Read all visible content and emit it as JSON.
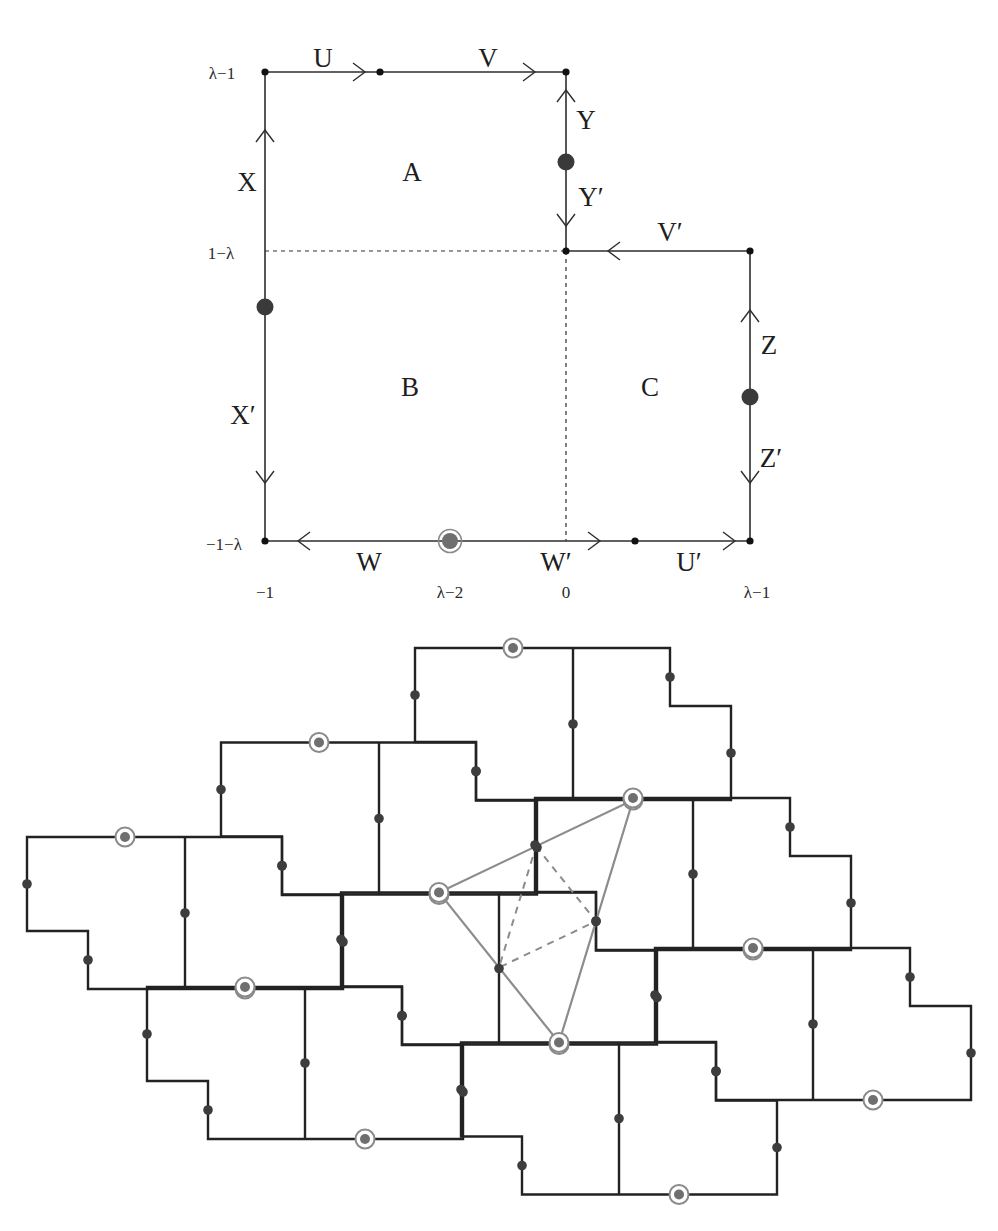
{
  "canvas": {
    "width": 998,
    "height": 1231,
    "background": "#ffffff"
  },
  "colors": {
    "top_line": "#2e2e2e",
    "tile_line": "#222222",
    "dot": "#3d3d3d",
    "marker_fill": "#6f6f6f",
    "marker_ring": "#8a8a8a",
    "triangle": "#8c8c8c"
  },
  "top_figure": {
    "outline": [
      [
        265,
        72
      ],
      [
        566,
        72
      ],
      [
        566,
        251
      ],
      [
        750,
        251
      ],
      [
        750,
        541
      ],
      [
        265,
        541
      ]
    ],
    "dashed": [
      [
        [
          265,
          251
        ],
        [
          566,
          251
        ]
      ],
      [
        [
          566,
          251
        ],
        [
          566,
          541
        ]
      ]
    ],
    "small_dots": [
      [
        265,
        72
      ],
      [
        380,
        72
      ],
      [
        566,
        72
      ],
      [
        566,
        251
      ],
      [
        750,
        251
      ],
      [
        750,
        541
      ],
      [
        635,
        541
      ],
      [
        265,
        541
      ]
    ],
    "big_dots": [
      [
        566,
        162
      ],
      [
        265,
        307
      ],
      [
        750,
        397
      ]
    ],
    "markers": [
      [
        450,
        541
      ]
    ],
    "arrows": [
      {
        "edge": "U",
        "x": 365,
        "y": 72,
        "dir": "right"
      },
      {
        "edge": "V",
        "x": 535,
        "y": 72,
        "dir": "right"
      },
      {
        "edge": "X",
        "x": 265,
        "y": 130,
        "dir": "up"
      },
      {
        "edge": "Y",
        "x": 566,
        "y": 90,
        "dir": "up"
      },
      {
        "edge": "Y′",
        "x": 566,
        "y": 226,
        "dir": "down"
      },
      {
        "edge": "V′",
        "x": 608,
        "y": 251,
        "dir": "left"
      },
      {
        "edge": "Z",
        "x": 750,
        "y": 310,
        "dir": "up"
      },
      {
        "edge": "Z′",
        "x": 750,
        "y": 483,
        "dir": "down"
      },
      {
        "edge": "X′",
        "x": 265,
        "y": 483,
        "dir": "down"
      },
      {
        "edge": "W",
        "x": 298,
        "y": 541,
        "dir": "left"
      },
      {
        "edge": "W′",
        "x": 600,
        "y": 541,
        "dir": "right"
      },
      {
        "edge": "U′",
        "x": 735,
        "y": 541,
        "dir": "right"
      }
    ],
    "edge_labels": [
      {
        "text": "U",
        "x": 323,
        "y": 58
      },
      {
        "text": "V",
        "x": 488,
        "y": 58
      },
      {
        "text": "X",
        "x": 247,
        "y": 182
      },
      {
        "text": "Y",
        "x": 586,
        "y": 120
      },
      {
        "text": "Y′",
        "x": 591,
        "y": 197
      },
      {
        "text": "V′",
        "x": 670,
        "y": 232
      },
      {
        "text": "Z",
        "x": 769,
        "y": 345
      },
      {
        "text": "Z′",
        "x": 771,
        "y": 458
      },
      {
        "text": "X′",
        "x": 243,
        "y": 415
      },
      {
        "text": "W",
        "x": 369,
        "y": 562
      },
      {
        "text": "W′",
        "x": 556,
        "y": 562
      },
      {
        "text": "U′",
        "x": 689,
        "y": 562
      }
    ],
    "region_labels": [
      {
        "text": "A",
        "x": 412,
        "y": 172
      },
      {
        "text": "B",
        "x": 410,
        "y": 387
      },
      {
        "text": "C",
        "x": 650,
        "y": 387
      }
    ],
    "y_ticks": [
      {
        "text": "λ−1",
        "x": 222,
        "y": 73
      },
      {
        "text": "1−λ",
        "x": 221,
        "y": 253
      },
      {
        "text": "−1−λ",
        "x": 224,
        "y": 544
      }
    ],
    "x_ticks": [
      {
        "text": "−1",
        "x": 265,
        "y": 592
      },
      {
        "text": "λ−2",
        "x": 450,
        "y": 592
      },
      {
        "text": "0",
        "x": 566,
        "y": 592
      },
      {
        "text": "λ−1",
        "x": 757,
        "y": 592
      }
    ]
  },
  "tiling": {
    "origin": [
      415,
      648
    ],
    "vec_a": [
      -194,
      94.5
    ],
    "vec_b": [
      120,
      150
    ],
    "tile_outline": [
      [
        0,
        0
      ],
      [
        255,
        0
      ],
      [
        255,
        58
      ],
      [
        316,
        58
      ],
      [
        316,
        152
      ],
      [
        61,
        152
      ],
      [
        61,
        94
      ],
      [
        0,
        94
      ]
    ],
    "tile_divider": [
      [
        158,
        0
      ],
      [
        158,
        152
      ]
    ],
    "tile_dots": [
      [
        0,
        47
      ],
      [
        61,
        123
      ],
      [
        255,
        29
      ],
      [
        316,
        105
      ],
      [
        158,
        76
      ]
    ],
    "tile_markers": [
      [
        98,
        0
      ],
      [
        218,
        152
      ]
    ],
    "tiles": [
      [
        0,
        0
      ],
      [
        1,
        0
      ],
      [
        2,
        0
      ],
      [
        0,
        1
      ],
      [
        1,
        1
      ],
      [
        2,
        1
      ],
      [
        0,
        2
      ],
      [
        1,
        2
      ]
    ],
    "triangle": [
      [
        439,
        892.5
      ],
      [
        633,
        800
      ],
      [
        559,
        1042.5
      ]
    ],
    "medial_triangle": [
      [
        536,
        846.25
      ],
      [
        596,
        921.25
      ],
      [
        499,
        967.5
      ]
    ]
  }
}
